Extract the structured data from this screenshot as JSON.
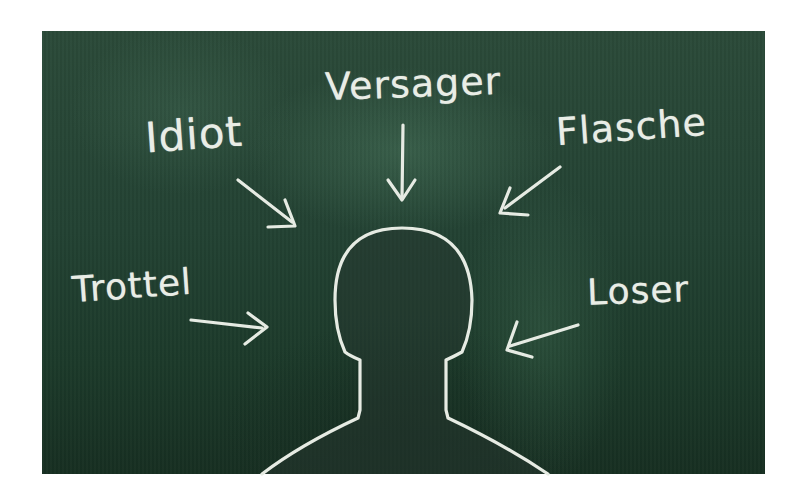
{
  "image": {
    "description": "Chalkboard illustration of a head silhouette with insulting words pointing at it",
    "colors": {
      "board": "#234233",
      "chalk": "#e9ede6",
      "background": "#ffffff"
    }
  },
  "words": [
    {
      "id": "versager",
      "text": "Versager"
    },
    {
      "id": "idiot",
      "text": "Idiot"
    },
    {
      "id": "flasche",
      "text": "Flasche"
    },
    {
      "id": "trottel",
      "text": "Trottel"
    },
    {
      "id": "loser",
      "text": "Loser"
    }
  ]
}
